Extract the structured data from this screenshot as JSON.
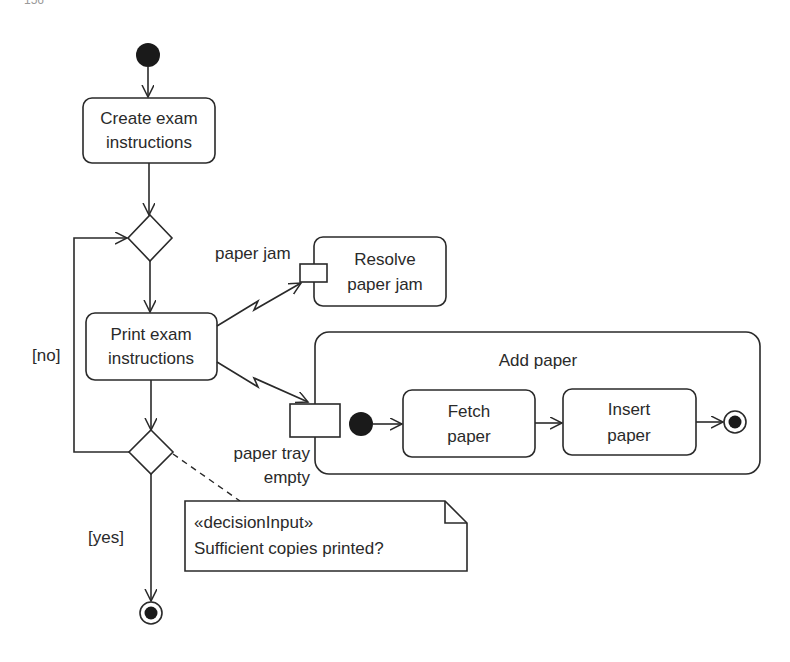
{
  "page": {
    "number_fragment": "156"
  },
  "diagram": {
    "type": "UML activity diagram",
    "colors": {
      "line": "#2a2a2a",
      "background": "#ffffff"
    },
    "actions": {
      "create": {
        "line1": "Create exam",
        "line2": "instructions"
      },
      "print": {
        "line1": "Print exam",
        "line2": "instructions"
      },
      "resolve": {
        "line1": "Resolve",
        "line2": "paper jam"
      },
      "fetch": {
        "line1": "Fetch",
        "line2": "paper"
      },
      "insert": {
        "line1": "Insert",
        "line2": "paper"
      }
    },
    "activity_frame": {
      "title": "Add paper"
    },
    "interrupts": {
      "jam": {
        "label": "paper jam"
      },
      "tray": {
        "line1": "paper tray",
        "line2": "empty"
      }
    },
    "guards": {
      "no": "[no]",
      "yes": "[yes]"
    },
    "note": {
      "stereotype": "«decisionInput»",
      "text": "Sufficient copies printed?"
    }
  }
}
